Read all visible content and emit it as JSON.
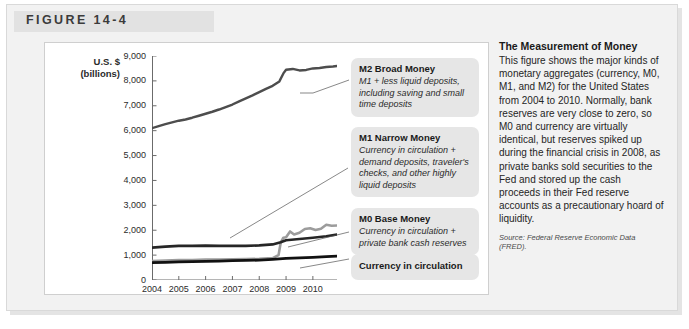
{
  "figure": {
    "label": "FIGURE 14-4"
  },
  "chart_data": {
    "type": "line",
    "title": "",
    "xlabel": "",
    "ylabel": "U.S. $ (billions)",
    "ylabel_line1": "U.S. $",
    "ylabel_line2": "(billions)",
    "xlim": [
      2004,
      2010.9
    ],
    "ylim": [
      0,
      9000
    ],
    "grid": false,
    "legend_position": "callout-boxes-right",
    "y_ticks": [
      "9,000",
      "8,000",
      "7,000",
      "6,000",
      "5,000",
      "4,000",
      "3,000",
      "2,000",
      "1,000",
      "0"
    ],
    "y_tick_values": [
      9000,
      8000,
      7000,
      6000,
      5000,
      4000,
      3000,
      2000,
      1000,
      0
    ],
    "x_ticks": [
      "2004",
      "2005",
      "2006",
      "2007",
      "2008",
      "2009",
      "2010"
    ],
    "x_tick_values": [
      2004,
      2005,
      2006,
      2007,
      2008,
      2009,
      2010
    ],
    "series": [
      {
        "name": "M2 Broad Money",
        "color": "#4d4d4d",
        "width": 2.4,
        "x": [
          2004.0,
          2004.25,
          2004.5,
          2004.75,
          2005.0,
          2005.25,
          2005.5,
          2005.75,
          2006.0,
          2006.25,
          2006.5,
          2006.75,
          2007.0,
          2007.25,
          2007.5,
          2007.75,
          2008.0,
          2008.25,
          2008.5,
          2008.75,
          2008.9,
          2009.0,
          2009.25,
          2009.5,
          2009.75,
          2010.0,
          2010.25,
          2010.5,
          2010.75,
          2010.9
        ],
        "values": [
          6100,
          6180,
          6260,
          6330,
          6400,
          6450,
          6520,
          6600,
          6680,
          6760,
          6850,
          6950,
          7050,
          7180,
          7300,
          7420,
          7550,
          7680,
          7800,
          7980,
          8300,
          8450,
          8480,
          8420,
          8440,
          8500,
          8520,
          8560,
          8580,
          8600
        ]
      },
      {
        "name": "M1 Narrow Money",
        "color": "#262626",
        "width": 2.6,
        "x": [
          2004.0,
          2004.5,
          2005.0,
          2005.5,
          2006.0,
          2006.5,
          2007.0,
          2007.5,
          2008.0,
          2008.5,
          2008.8,
          2009.0,
          2009.5,
          2010.0,
          2010.5,
          2010.9
        ],
        "values": [
          1300,
          1340,
          1370,
          1370,
          1380,
          1370,
          1370,
          1370,
          1390,
          1430,
          1520,
          1600,
          1650,
          1700,
          1760,
          1830
        ]
      },
      {
        "name": "M0 Base Money",
        "color": "#9c9c9c",
        "width": 2.6,
        "x": [
          2004.0,
          2004.5,
          2005.0,
          2005.5,
          2006.0,
          2006.5,
          2007.0,
          2007.5,
          2008.0,
          2008.5,
          2008.72,
          2008.8,
          2008.9,
          2009.0,
          2009.15,
          2009.3,
          2009.5,
          2009.7,
          2009.9,
          2010.1,
          2010.3,
          2010.5,
          2010.7,
          2010.9
        ],
        "values": [
          760,
          780,
          800,
          800,
          820,
          820,
          830,
          840,
          850,
          880,
          1000,
          1500,
          1700,
          1720,
          1950,
          1830,
          1900,
          2050,
          2080,
          2010,
          2060,
          2220,
          2180,
          2190
        ]
      },
      {
        "name": "Currency in circulation",
        "color": "#111111",
        "width": 2.8,
        "x": [
          2004.0,
          2004.5,
          2005.0,
          2005.5,
          2006.0,
          2006.5,
          2007.0,
          2007.5,
          2008.0,
          2008.5,
          2009.0,
          2009.5,
          2010.0,
          2010.5,
          2010.9
        ],
        "values": [
          700,
          710,
          725,
          735,
          750,
          760,
          775,
          785,
          800,
          830,
          870,
          890,
          910,
          940,
          960
        ]
      }
    ],
    "annotations": [
      {
        "series": "M2 Broad Money",
        "title": "M2 Broad Money",
        "description": "M1 + less liquid deposits, including saving and small time deposits"
      },
      {
        "series": "M1 Narrow Money",
        "title": "M1 Narrow Money",
        "description": "Currency in circulation + demand deposits, traveler's checks, and other highly liquid deposits"
      },
      {
        "series": "M0 Base Money",
        "title": "M0 Base Money",
        "description": "Currency in circulation + private bank cash reserves"
      },
      {
        "series": "Currency in circulation",
        "title": "Currency in circulation",
        "description": ""
      }
    ]
  },
  "text_panel": {
    "heading": "The Measurement of Money",
    "body": "This figure shows the major kinds of monetary aggregates (currency, M0, M1, and M2) for the United States from 2004 to 2010. Normally, bank reserves are very close to zero, so M0 and currency are virtually identical, but reserves spiked up during the financial crisis in 2008, as private banks sold securities to the Fed and stored up the cash proceeds in their Fed reserve accounts as a precautionary hoard of liquidity.",
    "source": "Source: Federal Reserve Economic Data (FRED)."
  },
  "colors": {
    "m2": "#4d4d4d",
    "m1": "#262626",
    "m0": "#9c9c9c",
    "currency": "#111111",
    "callout_bg": "#e6e6e6",
    "frame_bg": "#f2f2f2",
    "panel_bg": "#ffffff"
  }
}
